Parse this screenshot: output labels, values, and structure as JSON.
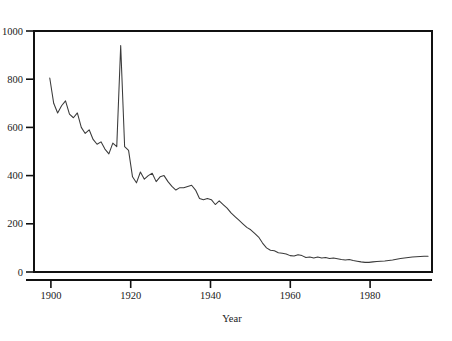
{
  "figure": {
    "title_partial": "(cut off at top edge)",
    "background_color": "#ffffff",
    "axis_color": "#111111",
    "line_color": "#3a3a3a"
  },
  "axes": {
    "x_title": "Year",
    "y_title": "",
    "x_tick_labels": [
      "1900",
      "1920",
      "1940",
      "1960",
      "1980"
    ],
    "y_tick_labels": [
      "0",
      "200",
      "400",
      "600",
      "800",
      "1000"
    ]
  },
  "chart_data": {
    "type": "line",
    "title": "",
    "xlabel": "Year",
    "ylabel": "",
    "xlim": [
      1896,
      1997
    ],
    "ylim": [
      0,
      1000
    ],
    "xticks": [
      1900,
      1920,
      1940,
      1960,
      1980
    ],
    "yticks": [
      0,
      200,
      400,
      600,
      800,
      1000
    ],
    "grid": false,
    "legend": "none",
    "annotations": [
      {
        "x": 1918,
        "y": 940,
        "text": "1918 influenza pandemic spike"
      }
    ],
    "series": [
      {
        "name": "Mortality rate",
        "x": [
          1900,
          1901,
          1902,
          1903,
          1904,
          1905,
          1906,
          1907,
          1908,
          1909,
          1910,
          1911,
          1912,
          1913,
          1914,
          1915,
          1916,
          1917,
          1918,
          1919,
          1920,
          1921,
          1922,
          1923,
          1924,
          1925,
          1926,
          1927,
          1928,
          1929,
          1930,
          1931,
          1932,
          1933,
          1934,
          1935,
          1936,
          1937,
          1938,
          1939,
          1940,
          1941,
          1942,
          1943,
          1944,
          1945,
          1946,
          1947,
          1948,
          1949,
          1950,
          1951,
          1952,
          1953,
          1954,
          1955,
          1956,
          1957,
          1958,
          1959,
          1960,
          1961,
          1962,
          1963,
          1964,
          1965,
          1966,
          1967,
          1968,
          1969,
          1970,
          1971,
          1972,
          1973,
          1974,
          1975,
          1976,
          1977,
          1978,
          1979,
          1980,
          1981,
          1982,
          1983,
          1984,
          1985,
          1986,
          1987,
          1988,
          1989,
          1990,
          1991,
          1992,
          1993,
          1994,
          1995,
          1996
        ],
        "values": [
          805,
          700,
          660,
          690,
          710,
          655,
          640,
          660,
          600,
          575,
          590,
          550,
          530,
          540,
          510,
          490,
          535,
          520,
          940,
          520,
          505,
          395,
          370,
          415,
          385,
          400,
          410,
          375,
          395,
          400,
          375,
          355,
          340,
          350,
          350,
          355,
          360,
          340,
          305,
          300,
          305,
          300,
          280,
          295,
          280,
          265,
          245,
          230,
          215,
          200,
          185,
          175,
          160,
          145,
          120,
          100,
          90,
          88,
          80,
          78,
          75,
          68,
          66,
          72,
          68,
          60,
          62,
          58,
          62,
          58,
          60,
          56,
          58,
          55,
          52,
          50,
          52,
          48,
          45,
          42,
          40,
          40,
          42,
          44,
          45,
          46,
          48,
          50,
          53,
          56,
          58,
          60,
          62,
          63,
          64,
          65,
          65
        ]
      }
    ]
  }
}
